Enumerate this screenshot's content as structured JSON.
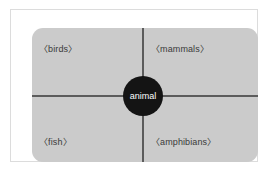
{
  "diagram": {
    "center_node": {
      "label": "animal",
      "fill_color": "#141414",
      "text_color": "#ffffff"
    },
    "panel": {
      "fill_color": "#cbcbcb",
      "divider_color": "#5c5c5c"
    },
    "frame": {
      "border_color": "#dcdcdc",
      "background_color": "#ffffff"
    },
    "quadrants": [
      {
        "position": "top-left",
        "label": "〈birds〉"
      },
      {
        "position": "top-right",
        "label": "〈mammals〉"
      },
      {
        "position": "bottom-left",
        "label": "〈fish〉"
      },
      {
        "position": "bottom-right",
        "label": "〈amphibians〉"
      }
    ]
  }
}
